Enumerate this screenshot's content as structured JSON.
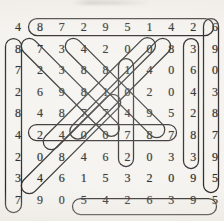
{
  "puzzle": {
    "kind": "number-search-grid",
    "rows": 10,
    "cols": 10,
    "ink_color": "#201f1c",
    "digit_color": "#1b1a18",
    "paper_color": "#f4f2ee",
    "grid": [
      [
        "4",
        "8",
        "7",
        "2",
        "9",
        "5",
        "1",
        "4",
        "2",
        "6"
      ],
      [
        "8",
        "7",
        "3",
        "4",
        "2",
        "0",
        "0",
        "8",
        "3",
        "9"
      ],
      [
        "7",
        "2",
        "3",
        "8",
        "8",
        "1",
        "4",
        "0",
        "6",
        "0"
      ],
      [
        "2",
        "6",
        "9",
        "8",
        "1",
        "0",
        "2",
        "0",
        "4",
        "3"
      ],
      [
        "8",
        "4",
        "8",
        "7",
        "7",
        "4",
        "9",
        "5",
        "2",
        "8"
      ],
      [
        "4",
        "2",
        "4",
        "0",
        "0",
        "7",
        "8",
        "7",
        "8",
        "7"
      ],
      [
        "2",
        "0",
        "8",
        "4",
        "6",
        "2",
        "0",
        "3",
        "3",
        "9"
      ],
      [
        "3",
        "4",
        "6",
        "1",
        "5",
        "3",
        "2",
        "0",
        "9",
        "5"
      ],
      [
        "7",
        "9",
        "0",
        "5",
        "4",
        "2",
        "6",
        "3",
        "9",
        "5"
      ]
    ],
    "circled_sequences": [
      {
        "id": "top-row-horizontal",
        "orientation": "horizontal",
        "digits": "8 7 2 9 5 1 4 2 6"
      },
      {
        "id": "bottom-row-horizontal",
        "orientation": "horizontal",
        "digits": "5 4 2 6 3 9 5"
      },
      {
        "id": "middle-row-horizontal",
        "orientation": "horizontal",
        "digits": "2 4 0 0 7 8 7"
      },
      {
        "id": "left-column-vertical",
        "orientation": "vertical",
        "digits": "8 7 2 8 4 2 3 7"
      },
      {
        "id": "right-column-vertical",
        "orientation": "vertical",
        "digits": "3 6 4 2 8 3"
      },
      {
        "id": "far-right-column-vertical",
        "orientation": "vertical",
        "digits": "6 9 0 3 8 7 9 5"
      },
      {
        "id": "center-column-vertical",
        "orientation": "vertical",
        "digits": "1 0 4 7 2"
      },
      {
        "id": "diagonal-down-right-a",
        "orientation": "diagonal-down-right",
        "digits": "7 3 8 7 0 0"
      },
      {
        "id": "diagonal-down-right-b",
        "orientation": "diagonal-down-right",
        "digits": "4 8 0 9 8 0"
      },
      {
        "id": "diagonal-down-left-a",
        "orientation": "diagonal-down-left",
        "digits": "8 4 0 7 6 3"
      },
      {
        "id": "diagonal-up-right-a",
        "orientation": "diagonal-up-right",
        "digits": "4 8 0 4 1 8"
      },
      {
        "id": "diagonal-up-right-b",
        "orientation": "diagonal-up-right",
        "digits": "0 2 7 9 0 8"
      }
    ]
  }
}
